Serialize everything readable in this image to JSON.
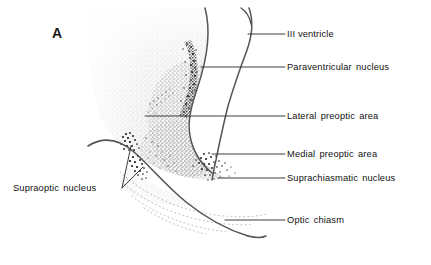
{
  "figure": {
    "panel_letter": "A",
    "caption_labels": [
      {
        "id": "iii-ventricle",
        "text": "III ventricle",
        "x": 287,
        "y": 30
      },
      {
        "id": "paraventricular-nucleus",
        "text": "Paraventricular nucleus",
        "x": 287,
        "y": 63
      },
      {
        "id": "lateral-preoptic-area",
        "text": "Lateral preoptic area",
        "x": 287,
        "y": 112
      },
      {
        "id": "medial-preoptic-area",
        "text": "Medial preoptic area",
        "x": 287,
        "y": 150
      },
      {
        "id": "suprachiasmatic-nucleus",
        "text": "Suprachiasmatic nucleus",
        "x": 287,
        "y": 174
      },
      {
        "id": "optic-chiasm",
        "text": "Optic chiasm",
        "x": 287,
        "y": 216
      },
      {
        "id": "supraoptic-nucleus",
        "text": "Supraoptic nucleus",
        "x": 13,
        "y": 184
      }
    ],
    "structures": [
      "tissue-field",
      "third-ventricle",
      "paraventricular-nucleus-cell-band",
      "supraoptic-nucleus-cell-cluster",
      "suprachiasmatic-nucleus-cell-cluster",
      "optic-chiasm-fiber-arcs",
      "brain-surface-outline"
    ],
    "colors": {
      "ink": "#555555",
      "text": "#111111",
      "tissue_stipple": "#8a8a8a",
      "dense_cells": "#1a1a1a",
      "background": "#ffffff",
      "tissue_wash": "#f1f1f1"
    }
  }
}
